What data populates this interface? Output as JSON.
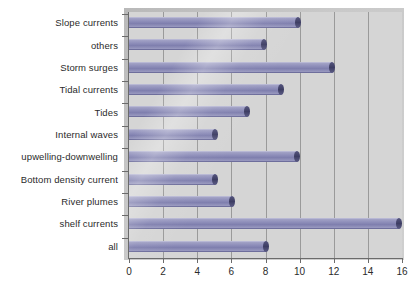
{
  "chart_data": {
    "type": "bar",
    "orientation": "horizontal",
    "title": "",
    "xlabel": "",
    "ylabel": "",
    "xlim": [
      0,
      16
    ],
    "xticks": [
      "0",
      "2",
      "4",
      "6",
      "8",
      "10",
      "12",
      "14",
      "16"
    ],
    "xtick_values": [
      0,
      2,
      4,
      6,
      8,
      10,
      12,
      14,
      16
    ],
    "grid": "vertical",
    "legend": "none",
    "categories": [
      "Slope currents",
      "others",
      "Storm surges",
      "Tidal currents",
      "Tides",
      "Internal waves",
      "upwelling-downwelling",
      "Bottom density current",
      "River plumes",
      "shelf currents",
      "all"
    ],
    "values": [
      10.1,
      8.1,
      12.1,
      9.1,
      7.1,
      5.2,
      10.0,
      5.2,
      6.2,
      16.0,
      8.2
    ],
    "colors": {
      "bar_fill": "#8f8fba",
      "bar_cap": "#42426a",
      "plot_background": "#d5d5d5",
      "gridline": "#9a9a9a",
      "axis": "#6b6b6b",
      "text": "#2b2b2b",
      "page_background": "#ffffff"
    }
  }
}
